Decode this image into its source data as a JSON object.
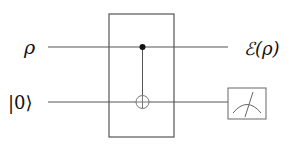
{
  "diagram": {
    "type": "quantum-circuit",
    "wires": [
      {
        "id": "top",
        "input_label": "ρ",
        "output_label": "ℰ(ρ)"
      },
      {
        "id": "bottom",
        "input_label": "|0⟩",
        "output": "measurement"
      }
    ],
    "gates": [
      {
        "type": "CNOT",
        "control_wire": "top",
        "target_wire": "bottom",
        "boxed": true
      }
    ],
    "colors": {
      "line": "#555555",
      "dot": "#111111",
      "text": "#111111"
    }
  }
}
